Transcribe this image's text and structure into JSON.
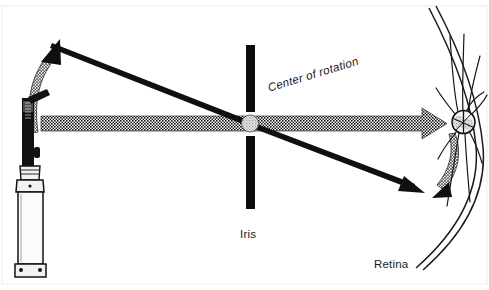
{
  "figure": {
    "title_labels": {
      "center_of_rotation": "Center of rotation",
      "iris": "Iris",
      "retina": "Retina"
    },
    "colors": {
      "ink": "#141414",
      "beam_fill": "#2b2b2b",
      "pivot_fill": "#d8d8d8",
      "paper": "#ffffff",
      "border": "#e2e2e2"
    },
    "elements": {
      "instrument_name": "retinoscope",
      "iris_bar_upper": "iris-upper-bar",
      "iris_bar_lower": "iris-lower-bar",
      "pivot_point": "center-of-rotation-marker",
      "retina_arc": "retina-arc",
      "optic_disc": "optic-disc",
      "sweep_arrow_left": "instrument-sweep-arrow",
      "sweep_arrow_right": "retinal-beam-sweep-arrow",
      "axis_beam": "horizontal-light-beam",
      "tilted_ray": "tilted-light-ray"
    }
  }
}
